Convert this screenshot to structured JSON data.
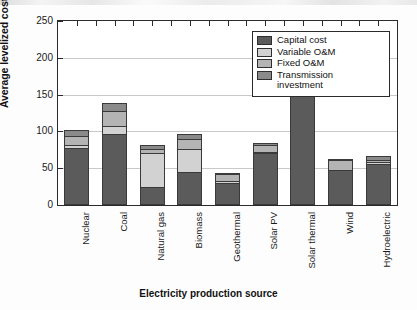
{
  "chart_data": {
    "type": "bar",
    "subtype": "stacked-bar",
    "title": "",
    "xlabel": "Electricity production source",
    "ylabel": "Average levelized cost, US$/MWh",
    "ylim": [
      0,
      250
    ],
    "yticks": [
      0,
      50,
      100,
      150,
      200,
      250
    ],
    "grid": true,
    "legend_position": "top-right",
    "categories": [
      "Nuclear",
      "Coal",
      "Natural gas",
      "Biomass",
      "Geothermal",
      "Solar PV",
      "Solar thermal",
      "Wind",
      "Hydroelectric"
    ],
    "series": [
      {
        "name": "Capital cost",
        "color": "#5b5b5b",
        "values": [
          78,
          97,
          25,
          45,
          30,
          71,
          185,
          48,
          56
        ]
      },
      {
        "name": "Variable O&M",
        "color": "#d2d2d2",
        "values": [
          4,
          10,
          46,
          31,
          2,
          1,
          44,
          0,
          2
        ]
      },
      {
        "name": "Fixed O&M",
        "color": "#b4b4b4",
        "values": [
          12,
          21,
          5,
          14,
          10,
          9,
          2,
          13,
          3
        ]
      },
      {
        "name": "Transmission investment",
        "color": "#8a8a8a",
        "values": [
          8,
          11,
          5,
          6,
          2,
          3,
          4,
          2,
          6
        ]
      }
    ],
    "totals": [
      102,
      139,
      81,
      96,
      44,
      84,
      235,
      63,
      67
    ]
  },
  "legend": {
    "items": [
      {
        "label": "Capital cost",
        "color": "#5b5b5b"
      },
      {
        "label": "Variable O&M",
        "color": "#d2d2d2"
      },
      {
        "label": "Fixed O&M",
        "color": "#b4b4b4"
      },
      {
        "label": "Transmission investment",
        "color": "#8a8a8a"
      }
    ]
  },
  "axes": {
    "y_title": "Average levelized cost, US$/MWh",
    "x_title": "Electricity production source",
    "y_tick_labels": [
      "0",
      "50",
      "100",
      "150",
      "200",
      "250"
    ]
  }
}
